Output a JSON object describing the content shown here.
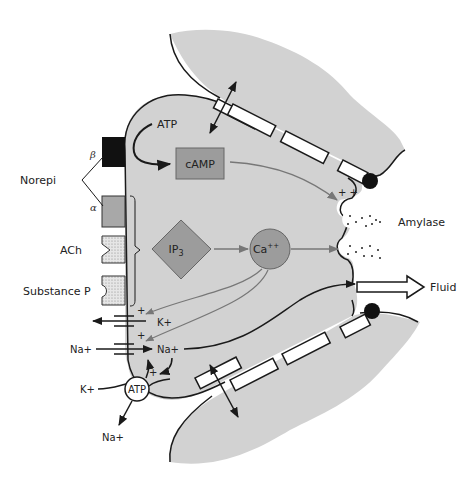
{
  "diagram": {
    "colors": {
      "cell_fill": "#d2d2d2",
      "box_fill": "#9c9c9c",
      "outline": "#1a1a1a",
      "gray_arrow": "#777777",
      "receptor_dark": "#111111",
      "background": "#ffffff"
    },
    "labels": {
      "norepi": "Norepi",
      "beta": "β",
      "alpha": "α",
      "ach": "ACh",
      "substance_p": "Substance P",
      "atp_top": "ATP",
      "camp": "cAMP",
      "ip3_main": "IP",
      "ip3_sub": "3",
      "ca_main": "Ca",
      "ca_sup": "++",
      "plus_plus": "+ +",
      "amylase": "Amylase",
      "fluid": "Fluid",
      "k_channel_ion": "K+",
      "na_out": "Na+",
      "na_in": "Na+",
      "k_pump_in": "K+",
      "atp_pump": "ATP",
      "na_pump_out": "Na+",
      "plus": "+"
    },
    "nodes": [
      {
        "id": "camp",
        "shape": "rectangle",
        "label": "cAMP"
      },
      {
        "id": "ip3",
        "shape": "diamond",
        "label": "IP3"
      },
      {
        "id": "ca",
        "shape": "circle",
        "label": "Ca++"
      },
      {
        "id": "atp_pump",
        "shape": "circle",
        "label": "ATP"
      }
    ],
    "edges": [
      {
        "from": "ATP",
        "to": "cAMP"
      },
      {
        "from": "cAMP",
        "to": "secretory granule (amylase)"
      },
      {
        "from": "IP3",
        "to": "Ca++"
      },
      {
        "from": "Ca++",
        "to": "secretory granule"
      },
      {
        "from": "Ca++",
        "to": "K+ channel"
      },
      {
        "from": "Ca++",
        "to": "Na+ channel"
      },
      {
        "from": "Na+",
        "to": "Fluid"
      }
    ]
  }
}
